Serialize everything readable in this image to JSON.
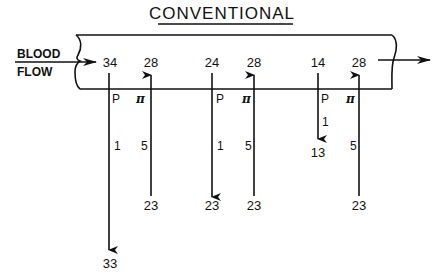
{
  "title": "CONVENTIONAL",
  "inflow": {
    "line1": "BLOOD",
    "line2": "FLOW"
  },
  "columns": [
    {
      "type": "P",
      "symbol": "P",
      "top_value": "34",
      "flux": "1",
      "bottom_value": "33",
      "direction": "down"
    },
    {
      "type": "pi",
      "symbol": "π",
      "top_value": "28",
      "flux": "5",
      "bottom_value": "23",
      "direction": "up"
    },
    {
      "type": "P",
      "symbol": "P",
      "top_value": "24",
      "flux": "1",
      "bottom_value": "23",
      "direction": "down"
    },
    {
      "type": "pi",
      "symbol": "π",
      "top_value": "28",
      "flux": "5",
      "bottom_value": "23",
      "direction": "up"
    },
    {
      "type": "P",
      "symbol": "P",
      "top_value": "14",
      "flux": "1",
      "bottom_value": "13",
      "direction": "down"
    },
    {
      "type": "pi",
      "symbol": "π",
      "top_value": "28",
      "flux": "5",
      "bottom_value": "23",
      "direction": "up"
    }
  ],
  "colors": {
    "ink": "#111111",
    "background": "#ffffff"
  }
}
